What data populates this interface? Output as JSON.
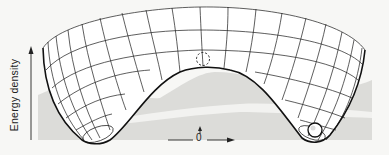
{
  "diagram": {
    "type": "potential-energy-surface",
    "y_axis_label": "Energy density",
    "origin_label": "0",
    "elements": {
      "surface": "mexican-hat potential wireframe",
      "peak_marker": "dashed circle (unstable position at top of hump)",
      "ball": "solid ball resting in trough (stable minimum)",
      "origin_arrows": "small up arrow and horizontal arrow at origin"
    },
    "colors": {
      "line": "#1a1a1a",
      "shadow": "#d6d6d4",
      "background": "#f7f7f5"
    }
  }
}
